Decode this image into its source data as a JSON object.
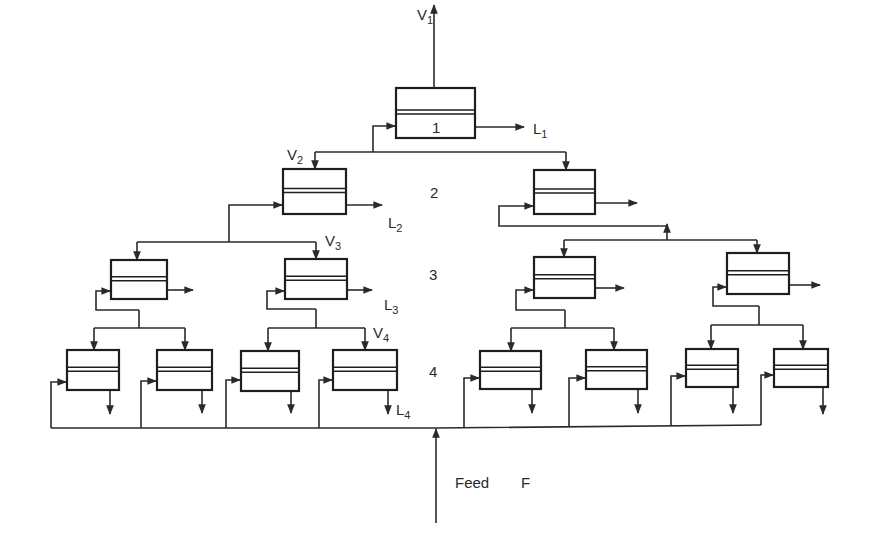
{
  "diagram": {
    "type": "multistage cascade flow diagram",
    "colors": {
      "line": "#2a2a2a",
      "background": "#ffffff"
    },
    "stage_labels": [
      {
        "text": "1",
        "x": 432,
        "y": 133
      },
      {
        "text": "2",
        "x": 430,
        "y": 198
      },
      {
        "text": "3",
        "x": 429,
        "y": 280
      },
      {
        "text": "4",
        "x": 429,
        "y": 377
      }
    ],
    "stream_labels": [
      {
        "main": "V",
        "sub": "1",
        "x": 417,
        "y": 20
      },
      {
        "main": "L",
        "sub": "1",
        "x": 533,
        "y": 134
      },
      {
        "main": "V",
        "sub": "2",
        "x": 287,
        "y": 160
      },
      {
        "main": "L",
        "sub": "2",
        "x": 388,
        "y": 228
      },
      {
        "main": "V",
        "sub": "3",
        "x": 325,
        "y": 246
      },
      {
        "main": "L",
        "sub": "3",
        "x": 384,
        "y": 310
      },
      {
        "main": "V",
        "sub": "4",
        "x": 373,
        "y": 338
      },
      {
        "main": "L",
        "sub": "4",
        "x": 396,
        "y": 415
      }
    ],
    "feed_label": {
      "text": "Feed",
      "symbol": "F",
      "x": 455,
      "y": 488
    },
    "units": [
      {
        "id": "1",
        "level": 1,
        "x": 396,
        "y": 88,
        "w": 79,
        "h": 50
      },
      {
        "id": "2a",
        "level": 2,
        "x": 283,
        "y": 169,
        "w": 63,
        "h": 45
      },
      {
        "id": "2b",
        "level": 2,
        "x": 534,
        "y": 170,
        "w": 61,
        "h": 44
      },
      {
        "id": "3a",
        "level": 3,
        "x": 111,
        "y": 260,
        "w": 56,
        "h": 39
      },
      {
        "id": "3b",
        "level": 3,
        "x": 285,
        "y": 259,
        "w": 62,
        "h": 40
      },
      {
        "id": "3c",
        "level": 3,
        "x": 534,
        "y": 257,
        "w": 61,
        "h": 41
      },
      {
        "id": "3d",
        "level": 3,
        "x": 727,
        "y": 253,
        "w": 62,
        "h": 41
      },
      {
        "id": "4a",
        "level": 4,
        "x": 67,
        "y": 350,
        "w": 52,
        "h": 40
      },
      {
        "id": "4b",
        "level": 4,
        "x": 157,
        "y": 350,
        "w": 55,
        "h": 40
      },
      {
        "id": "4c",
        "level": 4,
        "x": 241,
        "y": 351,
        "w": 58,
        "h": 40
      },
      {
        "id": "4d",
        "level": 4,
        "x": 333,
        "y": 350,
        "w": 64,
        "h": 40
      },
      {
        "id": "4e",
        "level": 4,
        "x": 480,
        "y": 351,
        "w": 61,
        "h": 38
      },
      {
        "id": "4f",
        "level": 4,
        "x": 586,
        "y": 350,
        "w": 61,
        "h": 39
      },
      {
        "id": "4g",
        "level": 4,
        "x": 686,
        "y": 349,
        "w": 52,
        "h": 38
      },
      {
        "id": "4h",
        "level": 4,
        "x": 774,
        "y": 349,
        "w": 54,
        "h": 38
      }
    ]
  }
}
